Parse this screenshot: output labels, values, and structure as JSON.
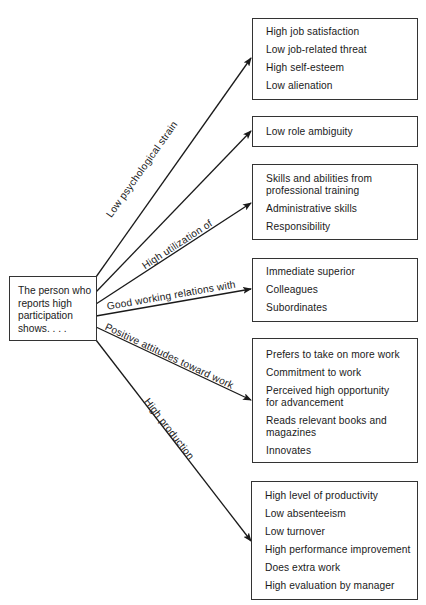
{
  "source": {
    "lines": [
      "The person who",
      "reports high",
      "participation",
      "shows. . . ."
    ]
  },
  "branches": [
    {
      "label": "Low psychological strain",
      "items": [
        "High job satisfaction",
        "Low job-related threat",
        "High self-esteem",
        "Low alienation"
      ]
    },
    {
      "label": "",
      "items": [
        "Low role ambiguity"
      ]
    },
    {
      "label": "High utilization of",
      "items": [
        "Skills and abilities from",
        "professional training",
        "Administrative skills",
        "Responsibility"
      ]
    },
    {
      "label": "Good working relations with",
      "items": [
        "Immediate superior",
        "Colleagues",
        "Subordinates"
      ]
    },
    {
      "label": "Positive attitudes toward work",
      "items": [
        "Prefers to take on more work",
        "Commitment to work",
        "Perceived high opportunity",
        "for advancement",
        "Reads relevant books and",
        "magazines",
        "Innovates"
      ]
    },
    {
      "label": "High production",
      "items": [
        "High level of productivity",
        "Low absenteeism",
        "Low turnover",
        "High performance improvement",
        "Does extra work",
        "High evaluation by manager"
      ]
    }
  ],
  "colors": {
    "line": "#1a1a1a",
    "border": "#333333",
    "background": "#ffffff"
  }
}
